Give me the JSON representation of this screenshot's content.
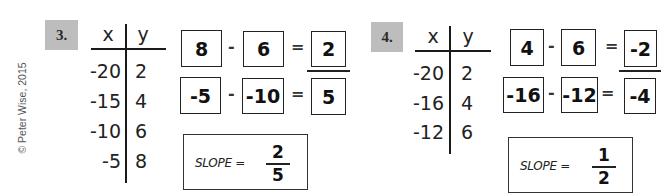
{
  "copyright": "© Peter Wise, 2015",
  "problems": [
    {
      "number": "3.",
      "table": {
        "headers": [
          "x",
          "y"
        ],
        "rows": [
          {
            "x": "-20",
            "y": "2"
          },
          {
            "x": "-15",
            "y": "4"
          },
          {
            "x": "-10",
            "y": "6"
          },
          {
            "x": "-5",
            "y": "8"
          }
        ]
      },
      "work": {
        "top": {
          "a": "8",
          "op": "-",
          "b": "6",
          "eq": "=",
          "result": "2"
        },
        "bottom": {
          "a": "-5",
          "op": "-",
          "b": "-10",
          "eq": "=",
          "result": "5"
        }
      },
      "slope": {
        "label": "SLOPE =",
        "numerator": "2",
        "denominator": "5"
      }
    },
    {
      "number": "4.",
      "table": {
        "headers": [
          "x",
          "y"
        ],
        "rows": [
          {
            "x": "-20",
            "y": "2"
          },
          {
            "x": "-16",
            "y": "4"
          },
          {
            "x": "-12",
            "y": "6"
          }
        ]
      },
      "work": {
        "top": {
          "a": "4",
          "op": "-",
          "b": "6",
          "eq": "=",
          "result": "-2"
        },
        "bottom": {
          "a": "-16",
          "op": "-",
          "b": "-12",
          "eq": "=",
          "result": "-4"
        }
      },
      "slope": {
        "label": "SLOPE =",
        "numerator": "1",
        "denominator": "2"
      }
    }
  ],
  "colors": {
    "badge": "#bdbdbd",
    "ink": "#1a1a1a",
    "background": "#ffffff"
  }
}
